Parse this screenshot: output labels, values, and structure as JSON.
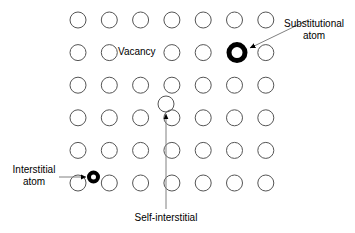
{
  "figure": {
    "background_color": "#ffffff",
    "atom_outline_color": "#555555",
    "defect_color": "#000000",
    "leader_line_color": "#808080"
  },
  "lattice": {
    "rows": 6,
    "columns": 7,
    "x_start": 78,
    "x_step": 31.3,
    "y_start": 20,
    "y_step": 32.6,
    "atom_radius": 8,
    "missing_sites": [
      {
        "row": 1,
        "col": 2,
        "reason": "vacancy-label-occupies-site"
      },
      {
        "row": 1,
        "col": 5,
        "reason": "substitutional-atom-occupies-site"
      }
    ]
  },
  "defects": [
    {
      "id": "substitutional-atom",
      "kind": "substitutional",
      "cx": 237,
      "cy": 52.6,
      "radius": 8,
      "stroke_width": 5,
      "color": "#000000"
    },
    {
      "id": "interstitial-atom",
      "kind": "interstitial",
      "cx": 93.5,
      "cy": 177,
      "radius": 4.5,
      "stroke_width": 4,
      "color": "#000000"
    },
    {
      "id": "self-interstitial-atom",
      "kind": "self-interstitial",
      "cx": 166,
      "cy": 104,
      "radius": 8,
      "stroke_width": 1,
      "color": "#555555"
    }
  ],
  "labels": {
    "vacancy": "Vacancy",
    "substitutional_line1": "Substitutional",
    "substitutional_line2": "atom",
    "interstitial_line1": "Interstitial",
    "interstitial_line2": "atom",
    "self_interstitial": "Self-interstitial"
  },
  "leaders": [
    {
      "id": "substitutional-leader",
      "from_x": 308,
      "from_y": 20,
      "to_x": 250,
      "to_y": 48,
      "arrow": "to"
    },
    {
      "id": "interstitial-leader",
      "from_x": 59,
      "from_y": 177,
      "to_x": 86,
      "to_y": 177,
      "arrow": "to"
    },
    {
      "id": "self-interstitial-leader",
      "from_x": 166,
      "from_y": 209,
      "to_x": 166,
      "to_y": 114,
      "arrow": "to"
    }
  ]
}
